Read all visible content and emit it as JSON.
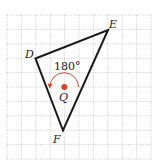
{
  "diagram": {
    "type": "rotation-on-grid",
    "grid": {
      "columns": 10,
      "rows": 10,
      "line_style": "dotted",
      "line_color": "#b8b8b8"
    },
    "triangle": {
      "vertices": [
        {
          "name": "D",
          "label": "D"
        },
        {
          "name": "E",
          "label": "E"
        },
        {
          "name": "F",
          "label": "F"
        }
      ],
      "stroke_color": "#1a1a1a"
    },
    "center": {
      "label": "Q",
      "color": "#d9452b"
    },
    "rotation": {
      "angle_label": "180°",
      "direction": "counterclockwise",
      "arc_color": "#d9452b"
    }
  }
}
